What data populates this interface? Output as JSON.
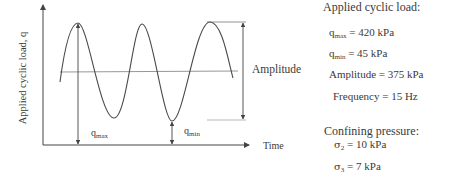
{
  "diagram": {
    "y_axis_label": "Applied cyclic load, q",
    "x_axis_label": "Time",
    "amplitude_label": "Amplitude",
    "qmax_label": {
      "base": "q",
      "sub": "max"
    },
    "qmin_label": {
      "base": "q",
      "sub": "min"
    },
    "colors": {
      "line": "#444444",
      "midline": "#8a8a8a",
      "text": "#3a3a3a"
    }
  },
  "applied_cyclic_load": {
    "heading": "Applied cyclic load:",
    "qmax": {
      "base": "q",
      "sub": "max",
      "value": " = 420 kPa"
    },
    "qmin": {
      "base": "q",
      "sub": "min",
      "value": " = 45 kPa"
    },
    "amplitude": "Amplitude = 375 kPa",
    "frequency": "Frequency = 15 Hz"
  },
  "confining_pressure": {
    "heading": "Confining pressure:",
    "sigma2": {
      "base": "σ",
      "sub": "2",
      "value": " = 10 kPa"
    },
    "sigma3": {
      "base": "σ",
      "sub": "3",
      "value": " = 7 kPa"
    }
  }
}
